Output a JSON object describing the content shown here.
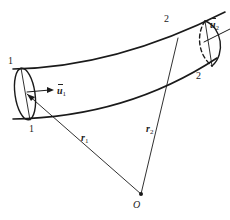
{
  "figure": {
    "colors": {
      "stroke": "#1a1a1a",
      "background": "#ffffff"
    },
    "section_1": {
      "top_label": "1",
      "bottom_label": "1",
      "velocity_label": "u",
      "velocity_sub": "1"
    },
    "section_2": {
      "top_label": "2",
      "bottom_label": "2",
      "velocity_label": "u",
      "velocity_sub": "2"
    },
    "position_vectors": [
      {
        "label": "r",
        "sub": "1"
      },
      {
        "label": "r",
        "sub": "2"
      }
    ],
    "origin_label": "O"
  }
}
